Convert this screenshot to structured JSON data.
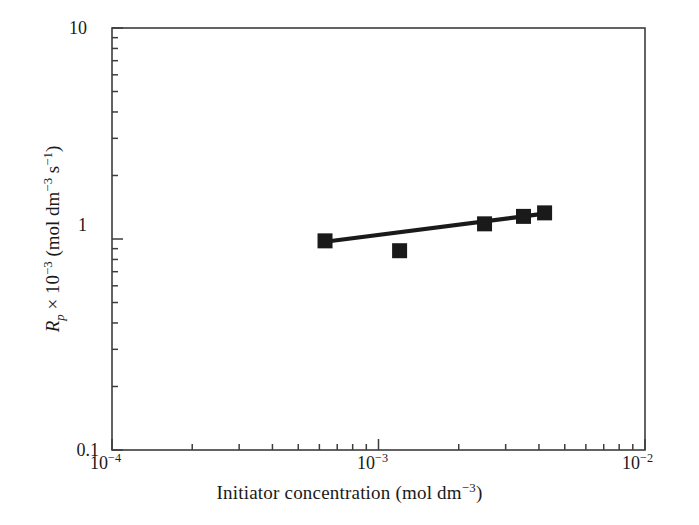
{
  "chart_data": {
    "type": "scatter",
    "title": "",
    "xlabel": "Initiator concentration (mol dm−3)",
    "ylabel": "Rp × 10−3 (mol dm−3 s−1)",
    "xscale": "log",
    "yscale": "log",
    "xlim": [
      0.0001,
      0.01
    ],
    "ylim": [
      0.1,
      10
    ],
    "grid": false,
    "legend": null,
    "x_tick_labels": [
      "10−4",
      "10−3",
      "10−2"
    ],
    "x_tick_values": [
      0.0001,
      0.001,
      0.01
    ],
    "y_tick_labels": [
      "0.1",
      "1",
      "10"
    ],
    "y_tick_values": [
      0.1,
      1,
      10
    ],
    "minor_ticks": true,
    "marker": "filled-square",
    "marker_color": "#1a1a1a",
    "line_color": "#1a1a1a",
    "series": [
      {
        "name": "Rp vs initiator concentration",
        "x": [
          0.00063,
          0.0012,
          0.0025,
          0.0035,
          0.0042
        ],
        "y": [
          0.98,
          0.88,
          1.18,
          1.28,
          1.33
        ]
      }
    ],
    "fit_line": {
      "x": [
        0.00063,
        0.0044
      ],
      "y": [
        0.97,
        1.33
      ],
      "description": "straight fit line on log-log axes"
    }
  },
  "axis": {
    "x_labels": [
      {
        "id": "x0",
        "text": "10",
        "exp": "−4"
      },
      {
        "id": "x1",
        "text": "10",
        "exp": "−3"
      },
      {
        "id": "x2",
        "text": "10",
        "exp": "−2"
      }
    ],
    "y_labels": [
      {
        "id": "y10",
        "text": "10"
      },
      {
        "id": "y1",
        "text": "1"
      },
      {
        "id": "y01",
        "text": "0.1"
      }
    ]
  },
  "labels": {
    "x_axis_title_main": "Initiator concentration (mol dm",
    "x_axis_title_exp": "−3",
    "x_axis_title_close": ")",
    "y_axis_title_R": "R",
    "y_axis_title_p": "p",
    "y_axis_title_mid": " × 10",
    "y_axis_title_exp1": "−3",
    "y_axis_title_unit": " (mol dm",
    "y_axis_title_exp2": "−3",
    "y_axis_title_s": " s",
    "y_axis_title_exp3": "−1",
    "y_axis_title_end": ")"
  },
  "colors": {
    "frame": "#3d3d3d",
    "ink": "#1a1a1a",
    "background": "#ffffff"
  }
}
